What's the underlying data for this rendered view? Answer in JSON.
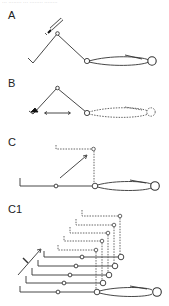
{
  "header": {
    "cut_text": "··· ········ ··· ········ ········"
  },
  "panels": {
    "a": {
      "label": "A",
      "description": "Leg extended with stimulus probe at knee joint"
    },
    "b": {
      "label": "B",
      "description": "Foot stimulus with horizontal displacement arrow; dashed displaced limb"
    },
    "c": {
      "label": "C",
      "description": "Straightened limb with dashed raised position and diagonal arrow"
    },
    "c1": {
      "label": "C1",
      "description": "Stack of five successive limb positions shifting up-right"
    }
  },
  "colors": {
    "line": "#333333",
    "dash": "#555555",
    "background": "#ffffff"
  },
  "c1_rows": 5
}
